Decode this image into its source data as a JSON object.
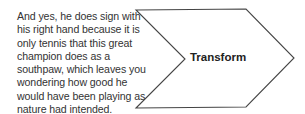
{
  "caption": {
    "lines": [
      "And yes, he does sign with",
      "his right hand because it is",
      "only tennis that this great",
      "champion does as a",
      "southpaw, which leaves you",
      "wondering how good he",
      "would have been playing as",
      "nature had intended."
    ]
  },
  "chevron": {
    "label": "Transform",
    "stroke_color": "#444444",
    "fill_color": "#ffffff",
    "points": "136,10 246,9 294,58 246,107 136,108 185,59"
  }
}
